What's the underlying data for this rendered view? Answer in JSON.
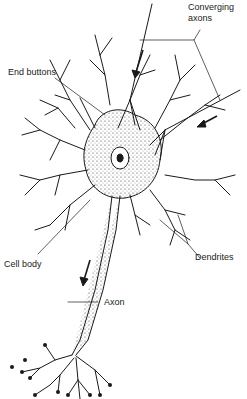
{
  "diagram": {
    "labels": {
      "converging_axons_line1": "Converging",
      "converging_axons_line2": "axons",
      "end_buttons": "End buttons",
      "dendrites": "Dendrites",
      "cell_body": "Cell body",
      "axon": "Axon"
    },
    "colors": {
      "ink": "#1a1a1a",
      "background": "#ffffff"
    }
  }
}
